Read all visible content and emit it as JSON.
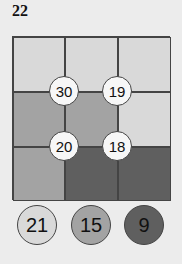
{
  "problem_number": "22",
  "colors": {
    "light": "#d9d9d9",
    "medium": "#a3a3a3",
    "dark": "#5f5f5f",
    "node_fill": "#f7f7f7"
  },
  "grid": {
    "rows": 3,
    "cols": 3,
    "cells": [
      [
        "light",
        "light",
        "light"
      ],
      [
        "medium",
        "medium",
        "light"
      ],
      [
        "medium",
        "dark",
        "dark"
      ]
    ]
  },
  "nodes": [
    {
      "value": "30",
      "x": 64,
      "y": 91
    },
    {
      "value": "19",
      "x": 117,
      "y": 91
    },
    {
      "value": "20",
      "x": 64,
      "y": 146
    },
    {
      "value": "18",
      "x": 117,
      "y": 146
    }
  ],
  "legend": [
    {
      "value": "21",
      "shade": "light",
      "x": 37,
      "y": 225
    },
    {
      "value": "15",
      "shade": "medium",
      "x": 91,
      "y": 225
    },
    {
      "value": "9",
      "shade": "dark",
      "x": 144,
      "y": 225
    }
  ]
}
